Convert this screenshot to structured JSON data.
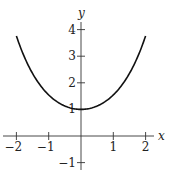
{
  "chart_data": {
    "type": "line",
    "title": "",
    "xlabel": "x",
    "ylabel": "y",
    "function": "cosh(x)",
    "xlim": [
      -2,
      2
    ],
    "ylim": [
      -1,
      4
    ],
    "xticks": [
      -2,
      -1,
      1,
      2
    ],
    "yticks": [
      -1,
      1,
      2,
      3,
      4
    ],
    "xtick_labels": [
      "−2",
      "−1",
      "1",
      "2"
    ],
    "ytick_labels": [
      "−1",
      "1",
      "2",
      "3",
      "4"
    ],
    "grid": false,
    "series": [
      {
        "name": "y = cosh(x)",
        "x": [
          -2,
          -1.5,
          -1,
          -0.5,
          0,
          0.5,
          1,
          1.5,
          2
        ],
        "y": [
          3.76,
          2.35,
          1.54,
          1.13,
          1.0,
          1.13,
          1.54,
          2.35,
          3.76
        ],
        "color": "#111111"
      }
    ]
  }
}
